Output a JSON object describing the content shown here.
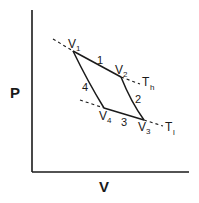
{
  "diagram": {
    "type": "pv-cycle",
    "axes": {
      "y_label": "P",
      "x_label": "V"
    },
    "vertices": [
      {
        "id": "v1",
        "label": "V",
        "sub": "1",
        "x": 73,
        "y": 51
      },
      {
        "id": "v2",
        "label": "V",
        "sub": "2",
        "x": 121,
        "y": 77
      },
      {
        "id": "v3",
        "label": "V",
        "sub": "3",
        "x": 144,
        "y": 120
      },
      {
        "id": "v4",
        "label": "V",
        "sub": "4",
        "x": 104,
        "y": 108
      }
    ],
    "segments": [
      {
        "label": "1",
        "from": "v1",
        "to": "v2"
      },
      {
        "label": "2",
        "from": "v2",
        "to": "v3"
      },
      {
        "label": "3",
        "from": "v4",
        "to": "v3"
      },
      {
        "label": "4",
        "from": "v1",
        "to": "v4"
      }
    ],
    "isotherms": [
      {
        "label": "T",
        "sub": "h"
      },
      {
        "label": "T",
        "sub": "l"
      }
    ]
  }
}
